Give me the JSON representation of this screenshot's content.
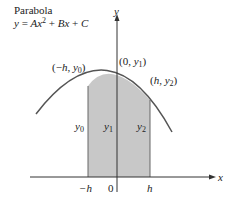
{
  "title": "Parabola",
  "equation": {
    "y": "y",
    "eq": "=",
    "A": "Ax",
    "exp": "2",
    "plus1": "+",
    "B": "Bx",
    "plus2": "+",
    "C": "C"
  },
  "axes": {
    "x_label": "x",
    "y_label": "y"
  },
  "points": {
    "left": {
      "open": "(−",
      "h": "h",
      "comma": ",",
      "y": "y",
      "sub": "0",
      "close": ")"
    },
    "mid": {
      "open": "(0,",
      "y": "y",
      "sub": "1",
      "close": ")"
    },
    "right": {
      "open": "(",
      "h": "h",
      "comma": ",",
      "y": "y",
      "sub": "2",
      "close": ")"
    }
  },
  "ordinates": [
    {
      "y": "y",
      "sub": "0"
    },
    {
      "y": "y",
      "sub": "1"
    },
    {
      "y": "y",
      "sub": "2"
    }
  ],
  "ticks": {
    "neg_h": "−h",
    "zero": "0",
    "h": "h"
  },
  "colors": {
    "shade": "#c8c8c8",
    "stroke": "#555555",
    "axis": "#333333"
  }
}
